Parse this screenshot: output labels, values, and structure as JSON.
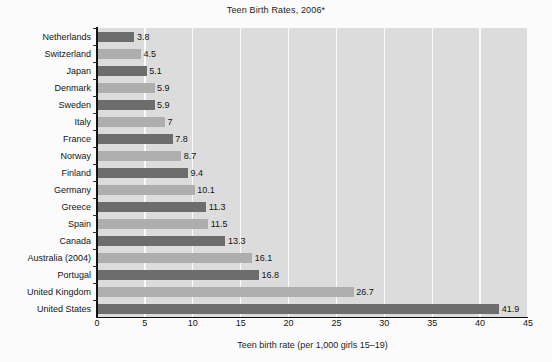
{
  "chart_data": {
    "type": "bar",
    "orientation": "horizontal",
    "title": "Teen Birth Rates, 2006*",
    "xlabel": "Teen birth rate (per 1,000 girls 15–19)",
    "ylabel": "",
    "xlim": [
      0,
      45
    ],
    "xticks": [
      0,
      5,
      10,
      15,
      20,
      25,
      30,
      35,
      40,
      45
    ],
    "xtick_labels": [
      "0",
      "5",
      "10",
      "15",
      "20",
      "25",
      "30",
      "35",
      "40",
      "45"
    ],
    "grid": "vertical-white-gridlines",
    "legend": "none",
    "categories": [
      "Netherlands",
      "Switzerland",
      "Japan",
      "Denmark",
      "Sweden",
      "Italy",
      "France",
      "Norway",
      "Finland",
      "Germany",
      "Greece",
      "Spain",
      "Canada",
      "Australia (2004)",
      "Portugal",
      "United Kingdom",
      "United States"
    ],
    "values": [
      3.8,
      4.5,
      5.1,
      5.9,
      5.9,
      7,
      7.8,
      8.7,
      9.4,
      10.1,
      11.3,
      11.5,
      13.3,
      16.1,
      16.8,
      26.7,
      41.9
    ],
    "value_labels": [
      "3.8",
      "4.5",
      "5.1",
      "5.9",
      "5.9",
      "7",
      "7.8",
      "8.7",
      "9.4",
      "10.1",
      "11.3",
      "11.5",
      "13.3",
      "16.1",
      "16.8",
      "26.7",
      "41.9"
    ],
    "bar_shades": [
      "dark",
      "light",
      "dark",
      "light",
      "dark",
      "light",
      "dark",
      "light",
      "dark",
      "light",
      "dark",
      "light",
      "dark",
      "light",
      "dark",
      "light",
      "dark"
    ],
    "colors": {
      "bar_dark": "#6d6d6d",
      "bar_light": "#aeaeae",
      "plot_background": "#dcdcdc",
      "gridline": "#fafafa",
      "axis": "#111111",
      "page_background": "#fbfbfb",
      "text": "#151515"
    }
  }
}
